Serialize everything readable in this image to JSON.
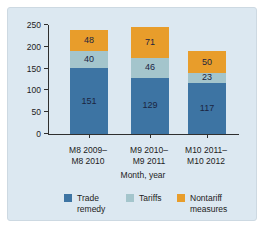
{
  "panel": {
    "background": "#dce8f1",
    "axis_color": "#2f2f2f",
    "text_color": "#1c1c1c",
    "value_label_color": "#1b2440"
  },
  "chart_data": {
    "type": "bar",
    "stacked": true,
    "title": "",
    "xlabel": "Month, year",
    "ylabel": "",
    "ylim": [
      0,
      250
    ],
    "yticks": [
      0,
      50,
      100,
      150,
      200,
      250
    ],
    "grid": false,
    "legend_position": "bottom",
    "categories": [
      "M8 2009–\nM8 2010",
      "M9 2010–\nM9 2011",
      "M10 2011–\nM10 2012"
    ],
    "series": [
      {
        "name": "Trade remedy",
        "color": "#3d74a3",
        "values": [
          151,
          129,
          117
        ]
      },
      {
        "name": "Tariffs",
        "color": "#a4c5cc",
        "values": [
          40,
          46,
          23
        ]
      },
      {
        "name": "Nontariff measures",
        "color": "#e89d2b",
        "values": [
          48,
          71,
          50
        ]
      }
    ]
  }
}
